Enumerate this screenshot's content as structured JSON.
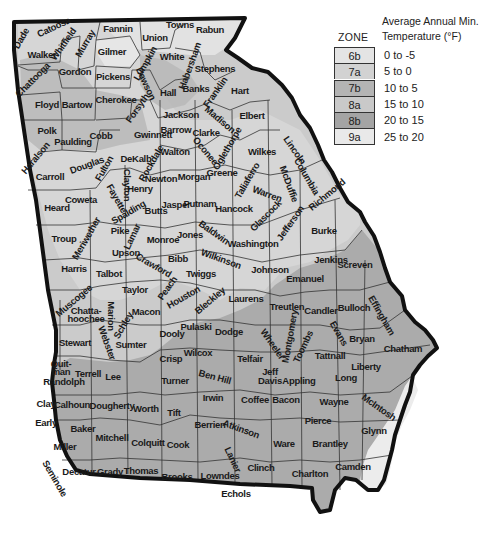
{
  "legend": {
    "zone_header": "ZONE",
    "title_line1": "Average Annual Min.",
    "title_line2": "Temperature (°F)",
    "zones": [
      {
        "zone": "6b",
        "range": "0 to -5",
        "color": "#e4e4e4"
      },
      {
        "zone": "7a",
        "range": "5 to 0",
        "color": "#d2d2d2"
      },
      {
        "zone": "7b",
        "range": "10 to 5",
        "color": "#b4b4b4"
      },
      {
        "zone": "8a",
        "range": "15 to 10",
        "color": "#c9c9c9"
      },
      {
        "zone": "8b",
        "range": "20 to 15",
        "color": "#a4a4a4"
      },
      {
        "zone": "9a",
        "range": "25 to 20",
        "color": "#e9e9e9"
      }
    ]
  },
  "map": {
    "state": "Georgia",
    "colors": {
      "zone_6b": "#e4e4e4",
      "zone_7a": "#d2d2d2",
      "zone_7b": "#b8b8b8",
      "zone_8a": "#cbcbcb",
      "zone_8b": "#a8a8a8",
      "zone_9a": "#ececec",
      "border": "#111111",
      "county_line": "#333333"
    },
    "counties": [
      {
        "name": "Dade",
        "x": 24,
        "y": 40,
        "rot": -60
      },
      {
        "name": "Catoosa",
        "x": 55,
        "y": 30,
        "rot": -25
      },
      {
        "name": "Whitfield",
        "x": 66,
        "y": 46,
        "rot": -55
      },
      {
        "name": "Murray",
        "x": 88,
        "y": 45,
        "rot": -60
      },
      {
        "name": "Walker",
        "x": 42,
        "y": 58,
        "rot": 0
      },
      {
        "name": "Fannin",
        "x": 118,
        "y": 32,
        "rot": 0
      },
      {
        "name": "Union",
        "x": 155,
        "y": 41,
        "rot": 0
      },
      {
        "name": "Towns",
        "x": 180,
        "y": 28,
        "rot": 0
      },
      {
        "name": "Rabun",
        "x": 210,
        "y": 33,
        "rot": 0
      },
      {
        "name": "Gilmer",
        "x": 112,
        "y": 55,
        "rot": 0
      },
      {
        "name": "White",
        "x": 172,
        "y": 60,
        "rot": 0
      },
      {
        "name": "Lumpkin",
        "x": 148,
        "y": 65,
        "rot": -60
      },
      {
        "name": "Habersham",
        "x": 193,
        "y": 67,
        "rot": -70
      },
      {
        "name": "Stephens",
        "x": 215,
        "y": 72,
        "rot": 0
      },
      {
        "name": "Chattooga",
        "x": 35,
        "y": 82,
        "rot": -45
      },
      {
        "name": "Gordon",
        "x": 75,
        "y": 75,
        "rot": 0
      },
      {
        "name": "Pickens",
        "x": 113,
        "y": 80,
        "rot": 0
      },
      {
        "name": "Dawson",
        "x": 143,
        "y": 85,
        "rot": 65
      },
      {
        "name": "Hall",
        "x": 168,
        "y": 96,
        "rot": 0
      },
      {
        "name": "Banks",
        "x": 196,
        "y": 92,
        "rot": 0
      },
      {
        "name": "Franklin",
        "x": 218,
        "y": 94,
        "rot": -55
      },
      {
        "name": "Hart",
        "x": 240,
        "y": 94,
        "rot": 0
      },
      {
        "name": "Floyd",
        "x": 47,
        "y": 108,
        "rot": 0
      },
      {
        "name": "Bartow",
        "x": 77,
        "y": 108,
        "rot": 0
      },
      {
        "name": "Cherokee",
        "x": 116,
        "y": 103,
        "rot": 0
      },
      {
        "name": "Forsyth",
        "x": 140,
        "y": 110,
        "rot": -55
      },
      {
        "name": "Jackson",
        "x": 181,
        "y": 118,
        "rot": 0
      },
      {
        "name": "Madison",
        "x": 218,
        "y": 122,
        "rot": 40
      },
      {
        "name": "Elbert",
        "x": 252,
        "y": 119,
        "rot": 0
      },
      {
        "name": "Barrow",
        "x": 176,
        "y": 133,
        "rot": 0
      },
      {
        "name": "Clarke",
        "x": 206,
        "y": 136,
        "rot": 0
      },
      {
        "name": "Polk",
        "x": 47,
        "y": 134,
        "rot": 0
      },
      {
        "name": "Paulding",
        "x": 73,
        "y": 145,
        "rot": 0
      },
      {
        "name": "Cobb",
        "x": 101,
        "y": 139,
        "rot": 0
      },
      {
        "name": "Gwinnett",
        "x": 153,
        "y": 138,
        "rot": 0
      },
      {
        "name": "Oconee",
        "x": 203,
        "y": 153,
        "rot": 50
      },
      {
        "name": "Oglethorpe",
        "x": 230,
        "y": 150,
        "rot": -60
      },
      {
        "name": "Wilkes",
        "x": 262,
        "y": 155,
        "rot": 0
      },
      {
        "name": "Lincoln",
        "x": 292,
        "y": 152,
        "rot": 55
      },
      {
        "name": "Haralson",
        "x": 38,
        "y": 160,
        "rot": -50
      },
      {
        "name": "Douglas",
        "x": 88,
        "y": 168,
        "rot": -20
      },
      {
        "name": "Fulton",
        "x": 107,
        "y": 170,
        "rot": -60
      },
      {
        "name": "DeKalb",
        "x": 136,
        "y": 162,
        "rot": 0
      },
      {
        "name": "Walton",
        "x": 175,
        "y": 155,
        "rot": 0
      },
      {
        "name": "Rockdale",
        "x": 154,
        "y": 165,
        "rot": -60
      },
      {
        "name": "Columbia",
        "x": 304,
        "y": 178,
        "rot": 60
      },
      {
        "name": "McDuffie",
        "x": 286,
        "y": 185,
        "rot": 70
      },
      {
        "name": "Carroll",
        "x": 50,
        "y": 180,
        "rot": 0
      },
      {
        "name": "Clayton",
        "x": 124,
        "y": 185,
        "rot": 90
      },
      {
        "name": "Newton",
        "x": 161,
        "y": 182,
        "rot": 0
      },
      {
        "name": "Morgan",
        "x": 194,
        "y": 180,
        "rot": 0
      },
      {
        "name": "Greene",
        "x": 222,
        "y": 176,
        "rot": 0
      },
      {
        "name": "Taliaferro",
        "x": 250,
        "y": 182,
        "rot": -60
      },
      {
        "name": "Warren",
        "x": 266,
        "y": 197,
        "rot": 20
      },
      {
        "name": "Richmond",
        "x": 329,
        "y": 197,
        "rot": -40
      },
      {
        "name": "Henry",
        "x": 140,
        "y": 192,
        "rot": 0
      },
      {
        "name": "Fayette",
        "x": 114,
        "y": 200,
        "rot": 60
      },
      {
        "name": "Coweta",
        "x": 81,
        "y": 203,
        "rot": 0
      },
      {
        "name": "Heard",
        "x": 57,
        "y": 211,
        "rot": 0
      },
      {
        "name": "Spalding",
        "x": 130,
        "y": 215,
        "rot": -30
      },
      {
        "name": "Butts",
        "x": 156,
        "y": 214,
        "rot": 0
      },
      {
        "name": "Jasper",
        "x": 176,
        "y": 208,
        "rot": 0
      },
      {
        "name": "Putnam",
        "x": 200,
        "y": 207,
        "rot": 0
      },
      {
        "name": "Hancock",
        "x": 234,
        "y": 212,
        "rot": 0
      },
      {
        "name": "Glascock",
        "x": 268,
        "y": 218,
        "rot": -45
      },
      {
        "name": "Jefferson",
        "x": 293,
        "y": 225,
        "rot": -55
      },
      {
        "name": "Burke",
        "x": 324,
        "y": 234,
        "rot": 0
      },
      {
        "name": "Troup",
        "x": 64,
        "y": 242,
        "rot": 0
      },
      {
        "name": "Meriwether",
        "x": 89,
        "y": 240,
        "rot": -60
      },
      {
        "name": "Pike",
        "x": 120,
        "y": 234,
        "rot": 0
      },
      {
        "name": "Lamar",
        "x": 135,
        "y": 238,
        "rot": -65
      },
      {
        "name": "Monroe",
        "x": 163,
        "y": 243,
        "rot": 0
      },
      {
        "name": "Jones",
        "x": 190,
        "y": 238,
        "rot": 0
      },
      {
        "name": "Baldwin",
        "x": 212,
        "y": 235,
        "rot": 35
      },
      {
        "name": "Washington",
        "x": 253,
        "y": 247,
        "rot": 0
      },
      {
        "name": "Jenkins",
        "x": 331,
        "y": 263,
        "rot": 0
      },
      {
        "name": "Screven",
        "x": 355,
        "y": 268,
        "rot": 0
      },
      {
        "name": "Upson",
        "x": 126,
        "y": 256,
        "rot": 0
      },
      {
        "name": "Wilkinson",
        "x": 220,
        "y": 262,
        "rot": 20
      },
      {
        "name": "Bibb",
        "x": 178,
        "y": 262,
        "rot": 0
      },
      {
        "name": "Crawford",
        "x": 152,
        "y": 268,
        "rot": 30
      },
      {
        "name": "Johnson",
        "x": 270,
        "y": 273,
        "rot": 0
      },
      {
        "name": "Emanuel",
        "x": 305,
        "y": 282,
        "rot": 0
      },
      {
        "name": "Harris",
        "x": 74,
        "y": 272,
        "rot": 0
      },
      {
        "name": "Talbot",
        "x": 109,
        "y": 277,
        "rot": 0
      },
      {
        "name": "Twiggs",
        "x": 201,
        "y": 277,
        "rot": 0
      },
      {
        "name": "Taylor",
        "x": 135,
        "y": 293,
        "rot": 0
      },
      {
        "name": "Peach",
        "x": 170,
        "y": 290,
        "rot": -55
      },
      {
        "name": "Houston",
        "x": 185,
        "y": 300,
        "rot": -30
      },
      {
        "name": "Bleckley",
        "x": 212,
        "y": 303,
        "rot": -40
      },
      {
        "name": "Laurens",
        "x": 246,
        "y": 302,
        "rot": 0
      },
      {
        "name": "Treutlen",
        "x": 287,
        "y": 310,
        "rot": 0
      },
      {
        "name": "Candler",
        "x": 321,
        "y": 314,
        "rot": 0
      },
      {
        "name": "Bulloch",
        "x": 354,
        "y": 311,
        "rot": 0
      },
      {
        "name": "Effingham",
        "x": 379,
        "y": 317,
        "rot": 60
      },
      {
        "name": "Muscogee",
        "x": 76,
        "y": 303,
        "rot": -40
      },
      {
        "name": "Chatta-",
        "x": 86,
        "y": 314,
        "rot": 0
      },
      {
        "name": "hoochee",
        "x": 86,
        "y": 322,
        "rot": 0
      },
      {
        "name": "Marion",
        "x": 108,
        "y": 316,
        "rot": 90
      },
      {
        "name": "Schley",
        "x": 126,
        "y": 327,
        "rot": -60
      },
      {
        "name": "Macon",
        "x": 146,
        "y": 315,
        "rot": 0
      },
      {
        "name": "Pulaski",
        "x": 196,
        "y": 330,
        "rot": 0
      },
      {
        "name": "Dodge",
        "x": 229,
        "y": 335,
        "rot": 0
      },
      {
        "name": "Wheeler",
        "x": 270,
        "y": 346,
        "rot": 55
      },
      {
        "name": "Montgomery",
        "x": 293,
        "y": 337,
        "rot": -80
      },
      {
        "name": "Toombs",
        "x": 306,
        "y": 348,
        "rot": -65
      },
      {
        "name": "Evans",
        "x": 336,
        "y": 335,
        "rot": 60
      },
      {
        "name": "Bryan",
        "x": 362,
        "y": 342,
        "rot": 0
      },
      {
        "name": "Chatham",
        "x": 403,
        "y": 352,
        "rot": 0
      },
      {
        "name": "Stewart",
        "x": 75,
        "y": 346,
        "rot": 0
      },
      {
        "name": "Webster",
        "x": 104,
        "y": 344,
        "rot": 70
      },
      {
        "name": "Sumter",
        "x": 131,
        "y": 348,
        "rot": 0
      },
      {
        "name": "Dooly",
        "x": 172,
        "y": 337,
        "rot": 0
      },
      {
        "name": "Crisp",
        "x": 171,
        "y": 362,
        "rot": 0
      },
      {
        "name": "Wilcox",
        "x": 198,
        "y": 356,
        "rot": 0
      },
      {
        "name": "Telfair",
        "x": 250,
        "y": 362,
        "rot": 0
      },
      {
        "name": "Tattnall",
        "x": 330,
        "y": 359,
        "rot": 0
      },
      {
        "name": "Liberty",
        "x": 366,
        "y": 370,
        "rot": 0
      },
      {
        "name": "Quit-",
        "x": 61,
        "y": 367,
        "rot": 0
      },
      {
        "name": "man",
        "x": 61,
        "y": 375,
        "rot": 0
      },
      {
        "name": "Terrell",
        "x": 88,
        "y": 377,
        "rot": 0
      },
      {
        "name": "Lee",
        "x": 113,
        "y": 380,
        "rot": 0
      },
      {
        "name": "Randolph",
        "x": 64,
        "y": 385,
        "rot": 0
      },
      {
        "name": "Turner",
        "x": 175,
        "y": 384,
        "rot": 0
      },
      {
        "name": "Ben Hill",
        "x": 214,
        "y": 380,
        "rot": 15
      },
      {
        "name": "Jeff",
        "x": 270,
        "y": 375,
        "rot": 0
      },
      {
        "name": "Davis",
        "x": 270,
        "y": 384,
        "rot": 0
      },
      {
        "name": "Appling",
        "x": 299,
        "y": 384,
        "rot": 0
      },
      {
        "name": "Long",
        "x": 346,
        "y": 381,
        "rot": 0
      },
      {
        "name": "Clay",
        "x": 46,
        "y": 407,
        "rot": 0
      },
      {
        "name": "Calhoun",
        "x": 72,
        "y": 408,
        "rot": 0
      },
      {
        "name": "Dougherty",
        "x": 112,
        "y": 409,
        "rot": 0
      },
      {
        "name": "Worth",
        "x": 146,
        "y": 412,
        "rot": 0
      },
      {
        "name": "Irwin",
        "x": 213,
        "y": 401,
        "rot": 0
      },
      {
        "name": "Tift",
        "x": 174,
        "y": 416,
        "rot": 0
      },
      {
        "name": "Coffee",
        "x": 255,
        "y": 403,
        "rot": 0
      },
      {
        "name": "Bacon",
        "x": 286,
        "y": 403,
        "rot": 0
      },
      {
        "name": "Wayne",
        "x": 334,
        "y": 405,
        "rot": 0
      },
      {
        "name": "McIntosh",
        "x": 377,
        "y": 410,
        "rot": 35
      },
      {
        "name": "Early",
        "x": 46,
        "y": 426,
        "rot": 0
      },
      {
        "name": "Baker",
        "x": 83,
        "y": 432,
        "rot": 0
      },
      {
        "name": "Mitchell",
        "x": 112,
        "y": 441,
        "rot": 0
      },
      {
        "name": "Berrien",
        "x": 210,
        "y": 428,
        "rot": 0
      },
      {
        "name": "Atkinson",
        "x": 240,
        "y": 432,
        "rot": 20
      },
      {
        "name": "Pierce",
        "x": 318,
        "y": 424,
        "rot": 0
      },
      {
        "name": "Glynn",
        "x": 374,
        "y": 434,
        "rot": 0
      },
      {
        "name": "Miller",
        "x": 65,
        "y": 450,
        "rot": 0
      },
      {
        "name": "Colquitt",
        "x": 148,
        "y": 446,
        "rot": 0
      },
      {
        "name": "Cook",
        "x": 178,
        "y": 448,
        "rot": 0
      },
      {
        "name": "Ware",
        "x": 284,
        "y": 447,
        "rot": 0
      },
      {
        "name": "Brantley",
        "x": 330,
        "y": 447,
        "rot": 0
      },
      {
        "name": "Seminole",
        "x": 52,
        "y": 480,
        "rot": 60
      },
      {
        "name": "Decatur",
        "x": 79,
        "y": 475,
        "rot": 0
      },
      {
        "name": "Grady",
        "x": 110,
        "y": 475,
        "rot": 0
      },
      {
        "name": "Thomas",
        "x": 141,
        "y": 474,
        "rot": 0
      },
      {
        "name": "Brooks",
        "x": 177,
        "y": 480,
        "rot": 0
      },
      {
        "name": "Lanier",
        "x": 230,
        "y": 461,
        "rot": 65
      },
      {
        "name": "Lowndes",
        "x": 220,
        "y": 479,
        "rot": 0
      },
      {
        "name": "Clinch",
        "x": 261,
        "y": 471,
        "rot": 0
      },
      {
        "name": "Charlton",
        "x": 310,
        "y": 477,
        "rot": 0
      },
      {
        "name": "Camden",
        "x": 353,
        "y": 470,
        "rot": 0
      },
      {
        "name": "Echols",
        "x": 236,
        "y": 497,
        "rot": 0
      }
    ]
  }
}
